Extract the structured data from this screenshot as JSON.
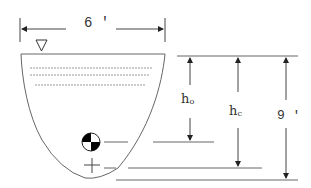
{
  "diagram": {
    "width_label": "6 '",
    "height_label": "9 '",
    "ho_label": "h",
    "ho_sub": "o",
    "hc_label": "h",
    "hc_sub": "c",
    "free_surface_symbol": "▽",
    "centroid_symbol": "centroid",
    "center_of_pressure_symbol": "+",
    "colors": {
      "line": "#555555",
      "fill": "#ffffff",
      "centroid_dark": "#000000"
    }
  }
}
